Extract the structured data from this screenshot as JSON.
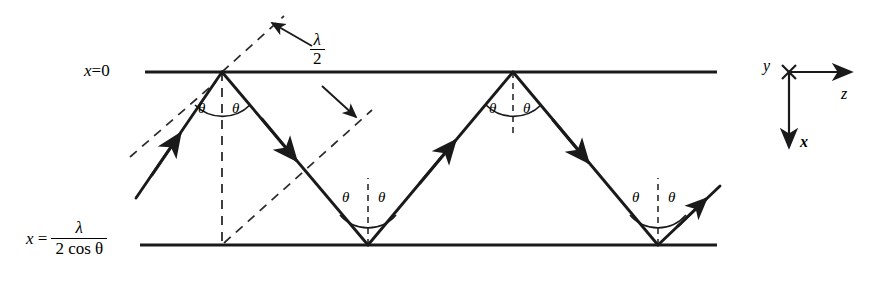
{
  "figure": {
    "type": "optics-waveguide-ray-diagram",
    "background_color": "#ffffff",
    "line_color": "#1a1a1a"
  },
  "boundaries": {
    "top": {
      "label_prefix": "x",
      "label_equals": "=",
      "label_value": "0",
      "full_label": "x = 0",
      "y_px": 72
    },
    "bottom": {
      "label_prefix": "x",
      "label_equals": "=",
      "numerator": "λ",
      "denominator": "2 cos θ",
      "full_label": "x = λ / (2 cos θ)",
      "y_px": 245
    }
  },
  "spacing_annotation": {
    "numerator": "λ",
    "denominator": "2",
    "full_label": "λ/2",
    "description": "perpendicular separation between successive wavefronts"
  },
  "angles": [
    {
      "id": "top1-left",
      "label": "θ",
      "x": 198,
      "y": 107
    },
    {
      "id": "top1-right",
      "label": "θ",
      "x": 232,
      "y": 107
    },
    {
      "id": "bottom1-left",
      "label": "θ",
      "x": 342,
      "y": 196
    },
    {
      "id": "bottom1-right",
      "label": "θ",
      "x": 378,
      "y": 196
    },
    {
      "id": "top2-left",
      "label": "θ",
      "x": 489,
      "y": 107
    },
    {
      "id": "top2-right",
      "label": "θ",
      "x": 523,
      "y": 107
    },
    {
      "id": "bottom2-left",
      "label": "θ",
      "x": 632,
      "y": 196
    },
    {
      "id": "bottom2-right",
      "label": "θ",
      "x": 668,
      "y": 196
    }
  ],
  "axes_key": {
    "y": {
      "label": "y",
      "glyph": "cross-out-of-page"
    },
    "z": {
      "label": "z",
      "direction": "right"
    },
    "x": {
      "label": "x",
      "direction": "down"
    },
    "origin_px": {
      "x": 789,
      "y": 72
    }
  }
}
